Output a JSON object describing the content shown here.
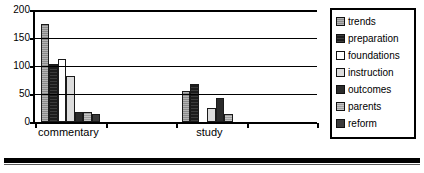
{
  "chart_data": {
    "type": "bar",
    "title": "",
    "xlabel": "",
    "ylabel": "",
    "categories": [
      "commentary",
      "study"
    ],
    "ylim": [
      0,
      200
    ],
    "yticks": [
      0,
      50,
      100,
      150,
      200
    ],
    "ytick_labels": [
      "0",
      "50",
      "100",
      "150",
      "200"
    ],
    "grid": "horizontal",
    "legend_position": "right",
    "series": [
      {
        "name": "trends",
        "values": [
          175,
          55
        ],
        "swatch": "fill-trends"
      },
      {
        "name": "preparation",
        "values": [
          103,
          68
        ],
        "swatch": "fill-preparation"
      },
      {
        "name": "foundations",
        "values": [
          113,
          0
        ],
        "swatch": "fill-foundations"
      },
      {
        "name": "instruction",
        "values": [
          83,
          25
        ],
        "swatch": "fill-instruction"
      },
      {
        "name": "outcomes",
        "values": [
          18,
          43
        ],
        "swatch": "fill-outcomes"
      },
      {
        "name": "parents",
        "values": [
          17,
          14
        ],
        "swatch": "fill-parents"
      },
      {
        "name": "reform",
        "values": [
          15,
          0
        ],
        "swatch": "fill-reform"
      }
    ]
  }
}
